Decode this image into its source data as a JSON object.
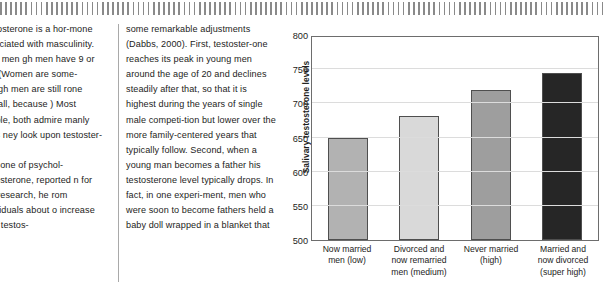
{
  "page": {
    "decorative_rule": "striped-vertical-ticks"
  },
  "columns": [
    {
      "name": "column-left",
      "paragraphs": [
        "Testosterone is a hor-mone associated with masculinity. Both men gh men have 9 or 10 . (Women are some- though men are still rone overall, because ) Most people, both admire manly traits ney look upon testoster-",
        "bbs, one of psychol-testosterone, reported n for this research, he rom individuals about o increase their testos-"
      ]
    },
    {
      "name": "column-right",
      "paragraphs": [
        "some remarkable adjustments (Dabbs, 2000). First, testoster-one reaches its peak in young men around the age of 20 and declines steadily after that, so that it is highest during the years of single male competi-tion but lower over the more family-centered years that typically follow. Second, when a young man becomes a father his testosterone level typically drops. In fact, in one experi-ment, men who were soon to become fathers held a baby doll wrapped in a blanket that"
      ]
    }
  ],
  "chart_data": {
    "type": "bar",
    "title": "",
    "xlabel": "",
    "ylabel": "Salivary testosterone levels",
    "ylim": [
      500,
      800
    ],
    "ytick_step": 50,
    "ticks": [
      "800",
      "750",
      "700",
      "650",
      "600",
      "550",
      "500"
    ],
    "gridlines": [
      750,
      700,
      650,
      600,
      550
    ],
    "grid": true,
    "legend": "none",
    "categories": [
      "Now married\nmen (low)",
      "Divorced and\nnow remarried\nmen (medium)",
      "Never married\n(high)",
      "Married and\nnow divorced\n(super high)"
    ],
    "values": [
      650,
      681,
      719,
      744
    ],
    "bar_colors": [
      "#b2b2b2",
      "#d9d9d9",
      "#9e9e9e",
      "#262626"
    ],
    "bar_border_color": "#4f4f4f",
    "axis_color": "#6d6d6d",
    "gridline_color": "#dcdcdc"
  }
}
